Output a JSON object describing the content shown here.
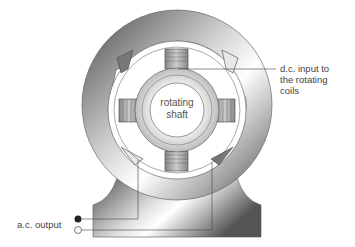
{
  "diagram": {
    "type": "alternator cross-section",
    "labels": {
      "shaft_line1": "rotating",
      "shaft_line2": "shaft",
      "dc_input_line1": "d.c. input to",
      "dc_input_line2": "the rotating",
      "dc_input_line3": "coils",
      "ac_output": "a.c. output"
    },
    "colors": {
      "dark_gray": "#555555",
      "mid_gray": "#9a9a9a",
      "light": "#f2f2f2",
      "line": "#444444"
    }
  }
}
